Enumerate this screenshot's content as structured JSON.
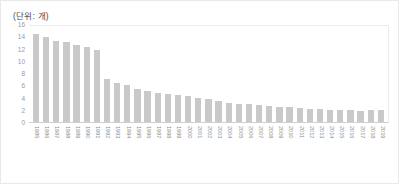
{
  "chart_data": {
    "type": "bar",
    "title": "(단위: 개)",
    "xlabel": "",
    "ylabel": "",
    "ylim": [
      0,
      16
    ],
    "yticks": [
      16,
      14,
      12,
      10,
      8,
      6,
      4,
      2,
      0
    ],
    "grid": false,
    "legend": null,
    "bar_color": "#c9c9c9",
    "categories": [
      "1985",
      "1986",
      "1987",
      "1988",
      "1989",
      "1990",
      "1991",
      "1992",
      "1993",
      "1994",
      "1995",
      "1996",
      "1997",
      "1998",
      "1999",
      "2000",
      "2001",
      "2002",
      "2003",
      "2004",
      "2005",
      "2006",
      "2007",
      "2008",
      "2009",
      "2010",
      "2011",
      "2012",
      "2013",
      "2014",
      "2015",
      "2016",
      "2017",
      "2018",
      "2019"
    ],
    "values": [
      14.3,
      13.8,
      13.2,
      13.0,
      12.5,
      12.2,
      11.7,
      7.0,
      6.3,
      6.0,
      5.4,
      5.0,
      4.7,
      4.5,
      4.4,
      4.2,
      3.9,
      3.7,
      3.4,
      3.1,
      3.0,
      2.9,
      2.8,
      2.6,
      2.5,
      2.4,
      2.3,
      2.2,
      2.1,
      2.0,
      1.9,
      1.9,
      1.8,
      1.9,
      2.0
    ]
  }
}
